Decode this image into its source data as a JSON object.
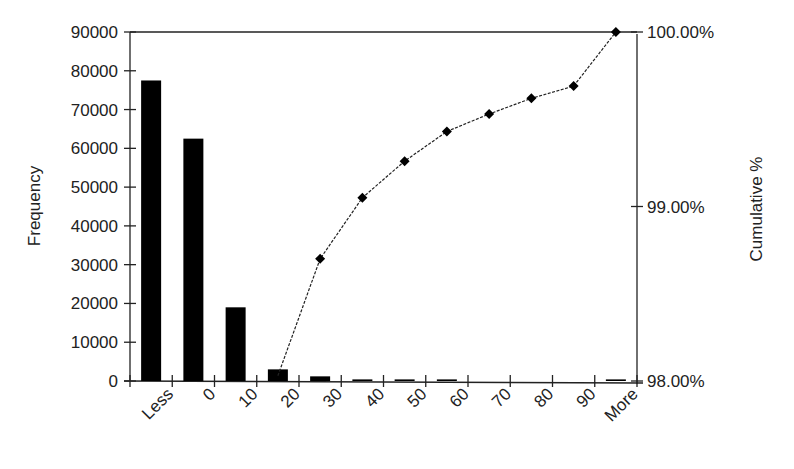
{
  "chart_data": {
    "type": "bar+line",
    "title": "",
    "categories": [
      "Less",
      "0",
      "10",
      "20",
      "30",
      "40",
      "50",
      "60",
      "70",
      "80",
      "90",
      "More"
    ],
    "series": [
      {
        "name": "Frequency",
        "type": "bar",
        "axis": "left",
        "values": [
          77500,
          62500,
          19000,
          3000,
          1200,
          300,
          200,
          150,
          0,
          0,
          0,
          100
        ]
      },
      {
        "name": "Cumulative %",
        "type": "line",
        "axis": "right",
        "marker": "diamond",
        "start_index": 3,
        "values": [
          null,
          null,
          null,
          98.03,
          98.7,
          99.05,
          99.26,
          99.43,
          99.53,
          99.62,
          99.69,
          100.0
        ]
      }
    ],
    "xlabel": "",
    "ylabel": "Frequency",
    "y2label": "Cumulative %",
    "ylim": [
      0,
      90000
    ],
    "y2lim": [
      98.0,
      100.0
    ],
    "yticks": [
      0,
      10000,
      20000,
      30000,
      40000,
      50000,
      60000,
      70000,
      80000,
      90000
    ],
    "yticklabels": [
      "0",
      "10000",
      "20000",
      "30000",
      "40000",
      "50000",
      "60000",
      "70000",
      "80000",
      "90000"
    ],
    "y2ticks": [
      98.0,
      99.0,
      100.0
    ],
    "y2ticklabels": [
      "98.00%",
      "99.00%",
      "100.00%"
    ],
    "grid": false,
    "legend": "none",
    "colors": {
      "bar": "#000000",
      "line": "#222222",
      "axis": "#222222"
    }
  }
}
